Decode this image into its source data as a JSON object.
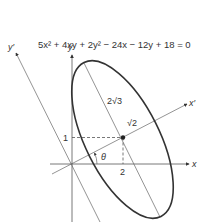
{
  "figure": {
    "equation": "5x² + 4xy + 2y² − 24x − 12y + 18 = 0",
    "axes": {
      "x_label": "x",
      "y_label": "y",
      "x_prime_label": "x′",
      "y_prime_label": "y′"
    },
    "annotations": {
      "major_axis_label": "2√3",
      "minor_semi_label": "√2",
      "angle_label": "θ",
      "center_x_tick": "2",
      "center_y_tick": "1"
    },
    "center": {
      "x": 2,
      "y": 1
    },
    "colors": {
      "ink": "#333333",
      "axis": "#555555",
      "background": "#ffffff"
    }
  }
}
